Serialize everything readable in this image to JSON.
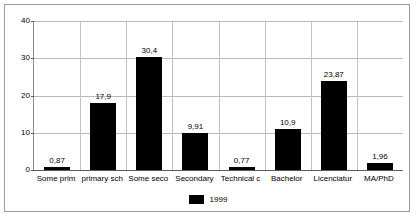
{
  "chart_data": {
    "type": "bar",
    "title": "",
    "xlabel": "",
    "ylabel": "",
    "ylim": [
      0,
      40
    ],
    "yticks": [
      0,
      10,
      20,
      30,
      40
    ],
    "ytick_labels": [
      "0",
      "10",
      "20",
      "30",
      "40"
    ],
    "grid": true,
    "legend_position": "bottom",
    "categories": [
      "Some prim",
      "primary sch",
      "Some seco",
      "Secondary",
      "Technical c",
      "Bachelor",
      "Licenciatur",
      "MA/PhD"
    ],
    "values": [
      0.87,
      17.9,
      30.4,
      9.91,
      0.77,
      10.9,
      23.87,
      1.96
    ],
    "value_labels": [
      "0,87",
      "17,9",
      "30,4",
      "9,91",
      "0,77",
      "10,9",
      "23,87",
      "1,96"
    ],
    "series": [
      {
        "name": "1999",
        "color": "#000000",
        "values": [
          0.87,
          17.9,
          30.4,
          9.91,
          0.77,
          10.9,
          23.87,
          1.96
        ]
      }
    ],
    "legend": [
      {
        "label": "1999",
        "color": "#000000"
      }
    ]
  },
  "colors": {
    "bar": "#000000",
    "gridline": "#b9b9b9",
    "axis": "#5a5a5a",
    "border": "#9a9a9a",
    "background": "#ffffff"
  }
}
